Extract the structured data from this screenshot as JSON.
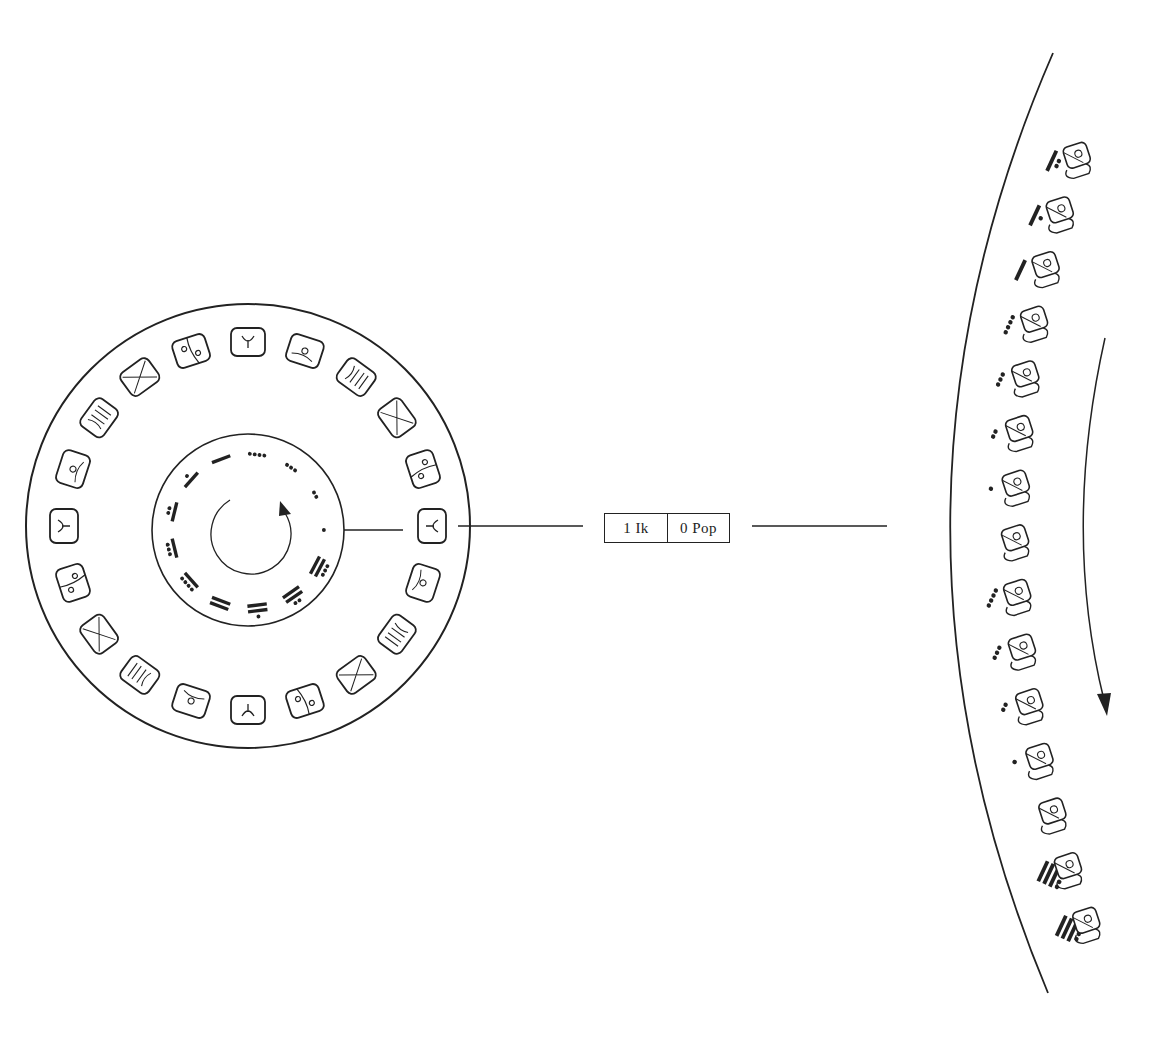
{
  "diagram": {
    "current_date": {
      "tzolkin": "1  Ik",
      "haab": "0 Pop"
    },
    "tzolkin_wheel": {
      "day_numbers": [
        1,
        2,
        3,
        4,
        5,
        6,
        7,
        8,
        9,
        10,
        11,
        12,
        13
      ],
      "notation": "bar-and-dot",
      "day_signs": [
        "Ik",
        "Akbal",
        "Kan",
        "Chicchan",
        "Cimi",
        "Manik",
        "Lamat",
        "Muluc",
        "Oc",
        "Chuen",
        "Eb",
        "Ben",
        "Ix",
        "Men",
        "Cib",
        "Caban",
        "Etznab",
        "Cauac",
        "Ahau",
        "Imix"
      ],
      "rotation": "counter-clockwise-arrow"
    },
    "haab_arc": {
      "entries_top_to_bottom": [
        {
          "number": 7,
          "month": "Wayeb-period glyph"
        },
        {
          "number": 6,
          "month": "Wayeb-period glyph"
        },
        {
          "number": 5,
          "month": "Wayeb-period glyph"
        },
        {
          "number": 4,
          "month": "Wayeb-period glyph"
        },
        {
          "number": 3,
          "month": "Wayeb-period glyph"
        },
        {
          "number": 2,
          "month": "Wayeb-period glyph"
        },
        {
          "number": 1,
          "month": "Wayeb-period glyph"
        },
        {
          "number": 0,
          "month": "Pop (seating)"
        },
        {
          "number": 4,
          "month": "Pop"
        },
        {
          "number": 3,
          "month": "Pop"
        },
        {
          "number": 2,
          "month": "Pop"
        },
        {
          "number": 1,
          "month": "Pop"
        },
        {
          "number": 0,
          "month": "Pop seating"
        },
        {
          "number": 19,
          "month": "Cumku"
        },
        {
          "number": 18,
          "month": "Cumku"
        }
      ],
      "direction": "downward-arrow"
    },
    "colors": {
      "ink": "#222222",
      "background": "#ffffff"
    }
  }
}
